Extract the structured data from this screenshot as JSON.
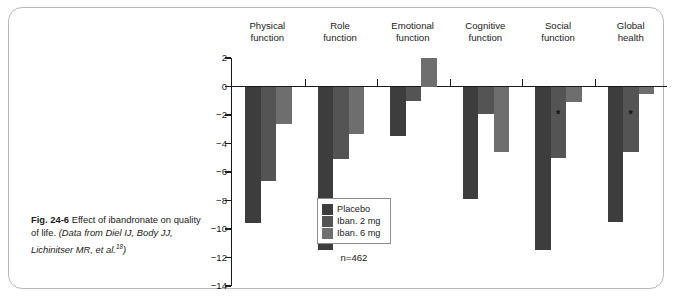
{
  "figure": {
    "label": "Fig. 24-6",
    "caption_text": "Effect of ibandronate on quality of life.",
    "source_text": "(Data from Diel IJ, Body JJ, Lichinitser MR, et al.",
    "source_ref": "18",
    "source_close": ")"
  },
  "sample_size": "n=462",
  "colors": {
    "placebo": "#3d3d3d",
    "iban2": "#545454",
    "iban6": "#6e6e6e",
    "axis": "#1a1a1a",
    "frame": "#b9b9b9"
  },
  "chart_data": {
    "type": "bar",
    "title": "",
    "subtitle": "",
    "xlabel": "",
    "ylabel": "",
    "ylim": [
      -14,
      2
    ],
    "yticks": [
      2,
      0,
      -2,
      -4,
      -6,
      -8,
      -10,
      -12,
      -14
    ],
    "ytick_labels": [
      "2",
      "0",
      "−2",
      "−4",
      "−6",
      "−8",
      "−10",
      "−12",
      "−14"
    ],
    "grid": false,
    "legend_position": "inside-bottom-center",
    "categories": [
      "Physical function",
      "Role function",
      "Emotional function",
      "Cognitive function",
      "Social function",
      "Global health"
    ],
    "category_lines": [
      [
        "Physical",
        "function"
      ],
      [
        "Role",
        "function"
      ],
      [
        "Emotional",
        "function"
      ],
      [
        "Cognitive",
        "function"
      ],
      [
        "Social",
        "function"
      ],
      [
        "Global",
        "health"
      ]
    ],
    "series": [
      {
        "name": "Placebo",
        "color": "#3d3d3d",
        "values": [
          -9.6,
          -11.5,
          -3.5,
          -7.9,
          -11.5,
          -9.5
        ],
        "significance": [
          false,
          false,
          false,
          false,
          false,
          false
        ]
      },
      {
        "name": "Iban. 2 mg",
        "color": "#545454",
        "values": [
          -6.6,
          -5.1,
          -1.0,
          -1.9,
          -5.0,
          -4.6
        ],
        "significance": [
          false,
          false,
          false,
          false,
          true,
          true
        ]
      },
      {
        "name": "Iban. 6 mg",
        "color": "#6e6e6e",
        "values": [
          -2.6,
          -3.3,
          2.0,
          -4.6,
          -1.1,
          -0.5
        ],
        "significance": [
          false,
          false,
          false,
          false,
          false,
          false
        ]
      }
    ],
    "annotations": [
      {
        "text": "*",
        "meaning": "significant vs placebo",
        "series": "Iban. 2 mg",
        "category": "Social function"
      },
      {
        "text": "*",
        "meaning": "significant vs placebo",
        "series": "Iban. 2 mg",
        "category": "Global health"
      }
    ]
  }
}
